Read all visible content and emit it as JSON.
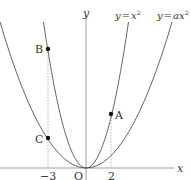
{
  "diagram": {
    "type": "parabolas",
    "axes": {
      "x_label": "x",
      "y_label": "y",
      "origin_label": "O"
    },
    "ticks": [
      {
        "value": -3,
        "label": "−3"
      },
      {
        "value": 2,
        "label": "2"
      }
    ],
    "curves": [
      {
        "id": "steep",
        "equation": "y = x²",
        "label_lhs": "y",
        "label_eq": "=",
        "label_rhs": "x",
        "label_exp": "2",
        "a": 1
      },
      {
        "id": "wide",
        "equation": "y = ax²",
        "label_lhs": "y",
        "label_eq": "=",
        "label_rhs": "ax",
        "label_exp": "2",
        "a": "a"
      }
    ],
    "points": [
      {
        "name": "A",
        "x": 2,
        "on": "y = x²"
      },
      {
        "name": "B",
        "x": -3,
        "on": "y = x²"
      },
      {
        "name": "C",
        "x": -3,
        "on": "y = ax²"
      }
    ],
    "colors": {
      "curve": "#555555",
      "axis": "#777777",
      "point": "#111111",
      "dashed": "#888888"
    }
  }
}
